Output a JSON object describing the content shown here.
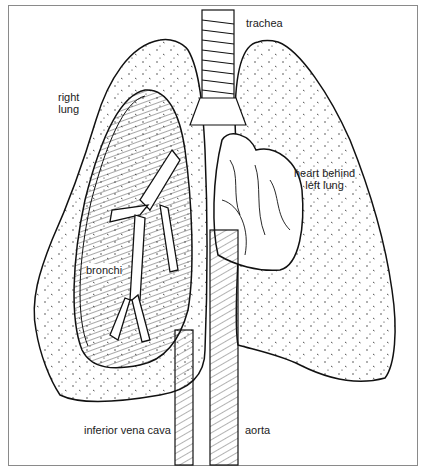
{
  "diagram": {
    "type": "anatomical-illustration",
    "labels": {
      "trachea": "trachea",
      "right_lung": [
        "right",
        "lung"
      ],
      "heart": [
        "heart behind",
        "left lung"
      ],
      "bronchi": "bronchi",
      "inferior_vena_cava": "inferior vena cava",
      "aorta": "aorta"
    },
    "colors": {
      "line": "#111111",
      "background": "#ffffff",
      "frame": "#8a8a8a"
    }
  }
}
